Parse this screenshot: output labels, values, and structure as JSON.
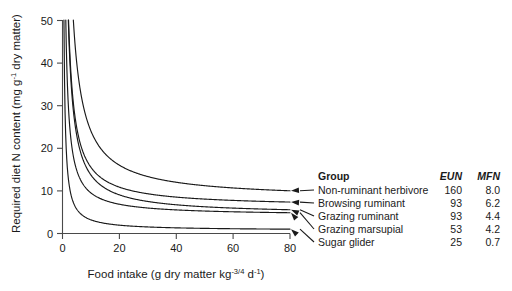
{
  "chart_data": {
    "type": "line",
    "title": "",
    "xlabel": "Food intake (g dry matter kg-3/4 d-1)",
    "ylabel": "Required diet N content (mg g-1 dry matter)",
    "xlim": [
      0,
      80
    ],
    "ylim": [
      0,
      50
    ],
    "xticks": [
      "0",
      "20",
      "40",
      "60",
      "80"
    ],
    "yticks": [
      "0",
      "10",
      "20",
      "30",
      "40",
      "50"
    ],
    "grid": false,
    "legend_position": "right",
    "model": "N = EUN / intake + MFN",
    "series": [
      {
        "name": "Non-ruminant herbivore",
        "EUN": 160,
        "MFN": 8.0
      },
      {
        "name": "Browsing ruminant",
        "EUN": 93,
        "MFN": 6.2
      },
      {
        "name": "Grazing ruminant",
        "EUN": 93,
        "MFN": 4.4
      },
      {
        "name": "Grazing marsupial",
        "EUN": 53,
        "MFN": 4.2
      },
      {
        "name": "Sugar glider",
        "EUN": 25,
        "MFN": 0.7
      }
    ]
  },
  "axes": {
    "y_title_main": "Required diet N content (mg g",
    "y_title_sup": "-1",
    "y_title_tail": " dry matter)",
    "x_title_main": "Food intake (g dry matter kg",
    "x_title_sup1": "-3/4",
    "x_title_mid": " d",
    "x_title_sup2": "-1",
    "x_title_tail": ")",
    "yticks": [
      "50",
      "40",
      "30",
      "20",
      "10",
      "0"
    ],
    "xticks": [
      "0",
      "20",
      "40",
      "60",
      "80"
    ]
  },
  "legend": {
    "header": {
      "group": "Group",
      "eun": "EUN",
      "mfn": "MFN"
    },
    "rows": [
      {
        "group": "Non-ruminant herbivore",
        "eun": "160",
        "mfn": "8.0"
      },
      {
        "group": "Browsing ruminant",
        "eun": "93",
        "mfn": "6.2"
      },
      {
        "group": "Grazing ruminant",
        "eun": "93",
        "mfn": "4.4"
      },
      {
        "group": "Grazing marsupial",
        "eun": "53",
        "mfn": "4.2"
      },
      {
        "group": "Sugar glider",
        "eun": "25",
        "mfn": "0.7"
      }
    ]
  },
  "colors": {
    "curve": "#1a1a1a",
    "axis": "#4a4a4a",
    "background": "#ffffff"
  }
}
